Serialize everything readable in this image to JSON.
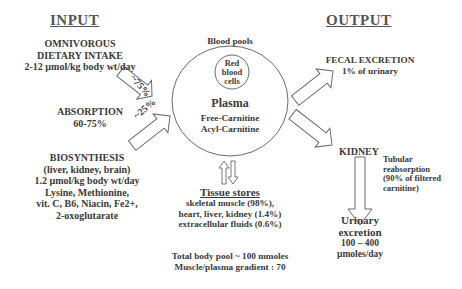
{
  "input": {
    "heading": "INPUT",
    "dietary": [
      "OMNIVOROUS",
      "DIETARY INTAKE",
      "2-12  µmol/kg body wt/day"
    ],
    "absorption": [
      "ABSORPTION",
      "60-75%"
    ],
    "biosynthesis": [
      "BIOSYNTHESIS",
      "(liver, kidney, brain)",
      "1.2  µmol/kg body wt/day",
      "Lysine, Methionine,",
      "vit. C, B6, Niacin, Fe2+,",
      "2-oxoglutarate"
    ],
    "arrow_upper_label": "~75%",
    "arrow_lower_label": "~25%"
  },
  "blood": {
    "title": "Blood pools",
    "rbc": [
      "Red",
      "blood",
      "cells"
    ],
    "plasma": "Plasma",
    "free": "Free-Carnitine",
    "acyl": "Acyl-Carnitine"
  },
  "tissue": {
    "title": "Tissue stores",
    "lines": [
      "skeletal muscle (98%),",
      "heart, liver, kidney (1.4%)",
      "extracellular fluids (0.6%)"
    ],
    "total": "Total  body pool ~ 100 mmoles",
    "gradient": "Muscle/plasma gradient : 70"
  },
  "output": {
    "heading": "OUTPUT",
    "fecal": [
      "FECAL EXCRETION",
      "1% of urinary"
    ],
    "kidney": "KIDNEY",
    "tubular": [
      "Tubular",
      "reabsorption",
      "(90% of filtered",
      "carnitine)"
    ],
    "urinary": [
      "Urinary",
      "excretion",
      "100 – 400",
      "µmoles/day"
    ]
  },
  "colors": {
    "text": "#3a3a3a",
    "stroke": "#6a6a6a",
    "background": "#ffffff"
  }
}
